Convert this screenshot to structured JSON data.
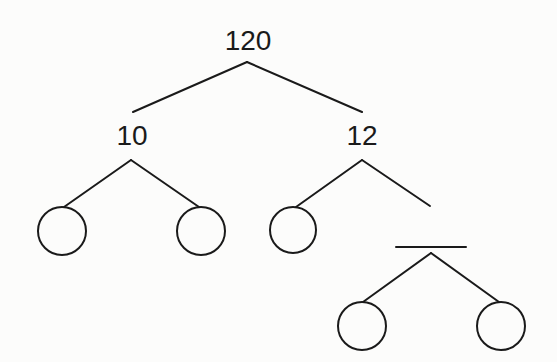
{
  "diagram": {
    "type": "factor-tree",
    "root": {
      "label": "120",
      "children": [
        {
          "label": "10",
          "children": [
            {
              "label": "",
              "kind": "empty-circle"
            },
            {
              "label": "",
              "kind": "empty-circle"
            }
          ]
        },
        {
          "label": "12",
          "children": [
            {
              "label": "",
              "kind": "empty-circle"
            },
            {
              "label": "",
              "kind": "blank-line",
              "children": [
                {
                  "label": "",
                  "kind": "empty-circle"
                },
                {
                  "label": "",
                  "kind": "empty-circle"
                }
              ]
            }
          ]
        }
      ]
    },
    "colors": {
      "stroke": "#1a1a1a",
      "background": "#fcfcfb"
    }
  }
}
